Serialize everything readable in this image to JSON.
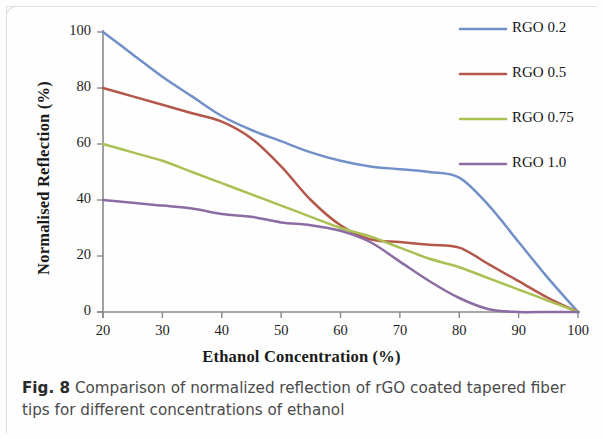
{
  "figure": {
    "caption_label": "Fig. 8",
    "caption_text": "Comparison of normalized reflection of rGO coated tapered fiber tips for different concentrations of ethanol"
  },
  "chart_data": {
    "type": "line",
    "title": "",
    "xlabel": "Ethanol Concentration (%)",
    "ylabel": "Normalised Reflection (%)",
    "xlim": [
      20,
      100
    ],
    "ylim": [
      0,
      100
    ],
    "xticks": [
      20,
      30,
      40,
      50,
      60,
      70,
      80,
      90,
      100
    ],
    "yticks": [
      0,
      20,
      40,
      60,
      80,
      100
    ],
    "grid": false,
    "legend_position": "top-right",
    "x": [
      20,
      25,
      30,
      35,
      40,
      45,
      50,
      55,
      60,
      65,
      70,
      75,
      80,
      85,
      90,
      95,
      100
    ],
    "series": [
      {
        "name": "RGO 0.2",
        "color": "#7190c8",
        "values": [
          100,
          92,
          84,
          77,
          70,
          65,
          61,
          57,
          54,
          52,
          51,
          50,
          48,
          38,
          25,
          12,
          0
        ]
      },
      {
        "name": "RGO 0.5",
        "color": "#b4574b",
        "values": [
          80,
          77,
          74,
          71,
          68,
          62,
          52,
          40,
          31,
          26,
          25,
          24,
          23,
          17,
          11,
          5,
          0
        ]
      },
      {
        "name": "RGO 0.75",
        "color": "#a9c153",
        "values": [
          60,
          57,
          54,
          50,
          46,
          42,
          38,
          34,
          30,
          27,
          23,
          19,
          16,
          12,
          8,
          4,
          0
        ]
      },
      {
        "name": "RGO 1.0",
        "color": "#8c6da3",
        "values": [
          40,
          39,
          38,
          37,
          35,
          34,
          32,
          31,
          29,
          25,
          18,
          11,
          5,
          1,
          0,
          0,
          0
        ]
      }
    ]
  },
  "legend": {
    "items": [
      {
        "label": "RGO 0.2",
        "color": "#7190c8"
      },
      {
        "label": "RGO 0.5",
        "color": "#b4574b"
      },
      {
        "label": "RGO 0.75",
        "color": "#a9c153"
      },
      {
        "label": "RGO 1.0",
        "color": "#8c6da3"
      }
    ]
  }
}
